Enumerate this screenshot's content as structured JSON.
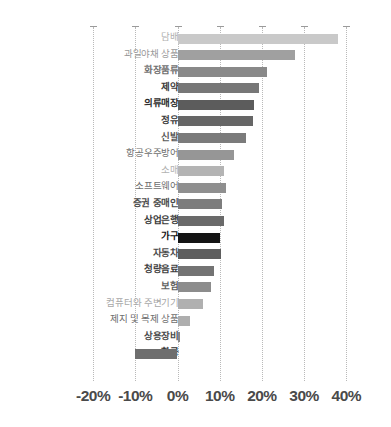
{
  "chart_data": {
    "type": "bar",
    "orientation": "horizontal",
    "title": "",
    "subtitle": "",
    "xlabel": "",
    "ylabel": "",
    "xlim": [
      -20,
      40
    ],
    "xticks": [
      -20,
      -10,
      0,
      10,
      20,
      30,
      40
    ],
    "xtick_labels": [
      "-20%",
      "-10%",
      "0%",
      "10%",
      "20%",
      "30%",
      "40%"
    ],
    "grid": true,
    "legend": false,
    "value_unit": "%",
    "categories": [
      "담배",
      "과일야채 상품",
      "화장품류",
      "제약",
      "의류매장",
      "정유",
      "신발",
      "항공우주방어",
      "소매",
      "소프트웨어",
      "증권 중매인",
      "상업은행",
      "가구",
      "자동차",
      "청량음료",
      "보험",
      "컴퓨터와 주변기기",
      "제지 및 목제 상품",
      "상용장비",
      "항공"
    ],
    "values": [
      38.0,
      27.8,
      21.2,
      19.2,
      18.2,
      17.8,
      16.2,
      13.5,
      11.0,
      11.5,
      10.6,
      11.0,
      10.0,
      10.4,
      8.6,
      8.0,
      6.0,
      3.0,
      0.6,
      -10.0
    ],
    "bar_colors": [
      "#c9c9c9",
      "#a0a0a0",
      "#898989",
      "#777777",
      "#5c5c5c",
      "#666666",
      "#7b7b7b",
      "#969696",
      "#b4b4b4",
      "#8f8f8f",
      "#7d7d7d",
      "#6a6a6a",
      "#141414",
      "#5e5e5e",
      "#737373",
      "#8c8c8c",
      "#b0b0b0",
      "#aeaeae",
      "#8a8a8a",
      "#6e6e6e"
    ],
    "label_colors": [
      "#b0b0b0",
      "#9a9a9a",
      "#707070",
      "#3a3a3a",
      "#2b2b2b",
      "#3a3a3a",
      "#5a5a5a",
      "#6e6e6e",
      "#b2b2b2",
      "#6e6e6e",
      "#4a4a4a",
      "#3a3a3a",
      "#111111",
      "#4a4a4a",
      "#3f3f3f",
      "#5f5f5f",
      "#a8a8a8",
      "#6e6e6e",
      "#4a4a4a",
      "#2e2e2e"
    ],
    "label_weights": [
      "normal",
      "normal",
      "bold",
      "bold",
      "bold",
      "bold",
      "bold",
      "normal",
      "normal",
      "normal",
      "bold",
      "bold",
      "bold",
      "bold",
      "bold",
      "bold",
      "normal",
      "normal",
      "bold",
      "bold"
    ]
  }
}
